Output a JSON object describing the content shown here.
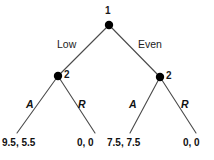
{
  "diagram": {
    "background_color": "#ffffff",
    "line_color": "#4a4a4a",
    "node_color": "#000000"
  },
  "nodes": {
    "root": {
      "player": "1",
      "x": 109,
      "y": 25,
      "label_x": 105,
      "label_y": 6
    },
    "left": {
      "player": "2",
      "x": 58,
      "y": 76,
      "label_x": 64,
      "label_y": 70
    },
    "right": {
      "player": "2",
      "x": 160,
      "y": 77,
      "label_x": 166,
      "label_y": 71
    }
  },
  "edges": [
    {
      "name": "root-to-left",
      "from": "root",
      "to": "left",
      "label": "Low"
    },
    {
      "name": "root-to-right",
      "from": "root",
      "to": "right",
      "label": "Even"
    },
    {
      "name": "left-to-leaf1",
      "from": "left",
      "to": "leaf1",
      "label": "A"
    },
    {
      "name": "left-to-leaf2",
      "from": "left",
      "to": "leaf2",
      "label": "R"
    },
    {
      "name": "right-to-leaf3",
      "from": "right",
      "to": "leaf3",
      "label": "A"
    },
    {
      "name": "right-to-leaf4",
      "from": "right",
      "to": "leaf4",
      "label": "R"
    }
  ],
  "move_labels": {
    "low": {
      "text": "Low",
      "x": 57,
      "y": 39
    },
    "even": {
      "text": "Even",
      "x": 138,
      "y": 39
    }
  },
  "action_labels": {
    "left_accept": {
      "text": "A",
      "x": 26,
      "y": 99
    },
    "left_reject": {
      "text": "R",
      "x": 78,
      "y": 99
    },
    "right_accept": {
      "text": "A",
      "x": 129,
      "y": 99
    },
    "right_reject": {
      "text": "R",
      "x": 181,
      "y": 99
    }
  },
  "payoffs": [
    {
      "name": "payoff-low-accept",
      "text": "9.5, 5.5",
      "x": 2,
      "y": 138
    },
    {
      "name": "payoff-low-reject",
      "text": "0,  0",
      "x": 77,
      "y": 138
    },
    {
      "name": "payoff-even-accept",
      "text": "7.5,  7.5",
      "x": 107,
      "y": 138
    },
    {
      "name": "payoff-even-reject",
      "text": "0,  0",
      "x": 183,
      "y": 138
    }
  ]
}
